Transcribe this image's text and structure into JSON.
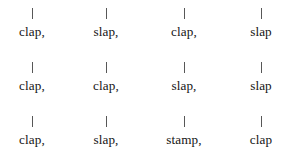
{
  "document": {
    "type": "rhythm-notation",
    "background_color": "#ffffff",
    "text_color": "#141414",
    "tick_color": "#575757",
    "columns": 4,
    "column_centers": [
      32,
      106,
      184,
      261
    ],
    "rows": [
      {
        "row_index": 1,
        "beats": [
          {
            "tick": "|",
            "label": "clap,"
          },
          {
            "tick": "|",
            "label": "slap,"
          },
          {
            "tick": "|",
            "label": "clap,"
          },
          {
            "tick": "|",
            "label": "slap"
          }
        ]
      },
      {
        "row_index": 2,
        "beats": [
          {
            "tick": "|",
            "label": "clap,"
          },
          {
            "tick": "|",
            "label": "clap,"
          },
          {
            "tick": "|",
            "label": "slap,"
          },
          {
            "tick": "|",
            "label": "slap"
          }
        ]
      },
      {
        "row_index": 3,
        "beats": [
          {
            "tick": "|",
            "label": "clap,"
          },
          {
            "tick": "|",
            "label": "slap,"
          },
          {
            "tick": "|",
            "label": "stamp,"
          },
          {
            "tick": "|",
            "label": "clap"
          }
        ]
      }
    ]
  }
}
